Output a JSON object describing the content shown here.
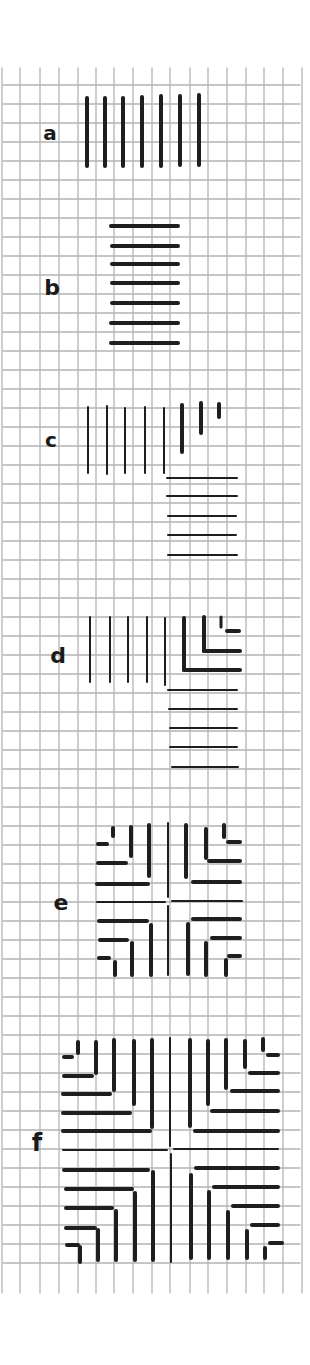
{
  "figure": {
    "background": "#ffffff",
    "grid": {
      "color": "#b4b4b4",
      "x_lines": [
        2,
        20,
        40,
        59,
        78,
        96,
        114,
        133,
        152,
        170,
        190,
        208,
        227,
        246,
        264,
        283,
        302
      ],
      "x_line_top": 68,
      "x_line_bottom": 1293,
      "y_start": 85,
      "y_step": 19,
      "y_count": 63,
      "h_left": 3,
      "h_right": 300
    },
    "ink": "#1e1e1e",
    "labels": [
      {
        "id": "a",
        "text": "a",
        "x": 50,
        "y": 133,
        "size": 20
      },
      {
        "id": "b",
        "text": "b",
        "x": 52,
        "y": 288,
        "size": 22
      },
      {
        "id": "c",
        "text": "c",
        "x": 51,
        "y": 440,
        "size": 20
      },
      {
        "id": "d",
        "text": "d",
        "x": 58,
        "y": 656,
        "size": 22
      },
      {
        "id": "e",
        "text": "e",
        "x": 61,
        "y": 903,
        "size": 22
      },
      {
        "id": "f",
        "text": "f",
        "x": 37,
        "y": 1143,
        "size": 24
      }
    ],
    "panels": [
      {
        "id": "a",
        "segments": [
          [
            87,
            98,
            87,
            166,
            4
          ],
          [
            105,
            98,
            105,
            166,
            4
          ],
          [
            123,
            98,
            123,
            166,
            4
          ],
          [
            142,
            97,
            142,
            166,
            4
          ],
          [
            161,
            96,
            161,
            166,
            4
          ],
          [
            180,
            96,
            180,
            165,
            4
          ],
          [
            199,
            95,
            199,
            165,
            4
          ]
        ]
      },
      {
        "id": "b",
        "segments": [
          [
            111,
            226,
            178,
            226,
            4
          ],
          [
            112,
            246,
            178,
            246,
            4
          ],
          [
            112,
            264,
            178,
            264,
            4
          ],
          [
            112,
            283,
            178,
            283,
            4
          ],
          [
            112,
            303,
            178,
            303,
            4
          ],
          [
            111,
            323,
            178,
            323,
            4
          ],
          [
            111,
            343,
            178,
            343,
            4
          ]
        ]
      },
      {
        "id": "c",
        "segments": [
          [
            88,
            407,
            88,
            473,
            2
          ],
          [
            107,
            406,
            107,
            474,
            2
          ],
          [
            125,
            408,
            125,
            473,
            2
          ],
          [
            145,
            407,
            145,
            473,
            2
          ],
          [
            164,
            408,
            164,
            473,
            2
          ],
          [
            182,
            405,
            182,
            452,
            4
          ],
          [
            201,
            403,
            201,
            433,
            4
          ],
          [
            219,
            404,
            219,
            417,
            4
          ],
          [
            167,
            478,
            237,
            478,
            2
          ],
          [
            167,
            496,
            237,
            496,
            2
          ],
          [
            168,
            516,
            236,
            516,
            2
          ],
          [
            168,
            535,
            236,
            535,
            2
          ],
          [
            168,
            555,
            237,
            555,
            2
          ]
        ]
      },
      {
        "id": "d",
        "segments": [
          [
            90,
            617,
            90,
            682,
            2
          ],
          [
            110,
            617,
            110,
            682,
            2
          ],
          [
            128,
            617,
            128,
            682,
            2
          ],
          [
            147,
            617,
            147,
            682,
            2
          ],
          [
            165,
            618,
            165,
            685,
            2
          ],
          [
            184,
            618,
            184,
            670,
            4
          ],
          [
            184,
            670,
            240,
            670,
            4
          ],
          [
            204,
            617,
            204,
            651,
            4
          ],
          [
            204,
            651,
            240,
            651,
            4
          ],
          [
            221,
            617,
            221,
            627,
            3
          ],
          [
            227,
            631,
            239,
            631,
            4
          ],
          [
            168,
            690,
            237,
            690,
            2
          ],
          [
            169,
            709,
            237,
            709,
            2
          ],
          [
            170,
            728,
            237,
            728,
            2
          ],
          [
            170,
            747,
            237,
            747,
            2
          ],
          [
            172,
            767,
            238,
            767,
            2
          ]
        ]
      },
      {
        "id": "e",
        "segments": [
          [
            168,
            823,
            168,
            897,
            2
          ],
          [
            168,
            906,
            168,
            975,
            2
          ],
          [
            97,
            902,
            165,
            902,
            2
          ],
          [
            172,
            901,
            242,
            901,
            2
          ],
          [
            149,
            825,
            149,
            876,
            4
          ],
          [
            131,
            827,
            131,
            856,
            4
          ],
          [
            113,
            828,
            113,
            836,
            4
          ],
          [
            97,
            884,
            148,
            884,
            4
          ],
          [
            98,
            863,
            126,
            863,
            4
          ],
          [
            98,
            844,
            107,
            844,
            4
          ],
          [
            186,
            825,
            186,
            877,
            4
          ],
          [
            206,
            829,
            206,
            858,
            4
          ],
          [
            224,
            825,
            224,
            837,
            4
          ],
          [
            193,
            882,
            240,
            882,
            4
          ],
          [
            209,
            861,
            240,
            861,
            4
          ],
          [
            228,
            842,
            240,
            842,
            4
          ],
          [
            99,
            921,
            147,
            921,
            4
          ],
          [
            100,
            940,
            127,
            940,
            4
          ],
          [
            99,
            958,
            109,
            958,
            4
          ],
          [
            151,
            925,
            151,
            975,
            4
          ],
          [
            132,
            943,
            132,
            975,
            4
          ],
          [
            115,
            962,
            115,
            975,
            4
          ],
          [
            193,
            919,
            240,
            919,
            4
          ],
          [
            212,
            938,
            240,
            938,
            4
          ],
          [
            229,
            956,
            240,
            956,
            4
          ],
          [
            188,
            924,
            188,
            974,
            4
          ],
          [
            206,
            943,
            206,
            975,
            4
          ],
          [
            226,
            960,
            226,
            975,
            4
          ]
        ]
      },
      {
        "id": "f",
        "segments": [
          [
            170,
            1038,
            170,
            1146,
            2
          ],
          [
            171,
            1154,
            171,
            1262,
            2
          ],
          [
            63,
            1150,
            167,
            1150,
            2
          ],
          [
            174,
            1149,
            278,
            1149,
            2
          ],
          [
            78,
            1042,
            78,
            1053,
            4
          ],
          [
            96,
            1042,
            96,
            1073,
            4
          ],
          [
            114,
            1040,
            114,
            1090,
            4
          ],
          [
            134,
            1041,
            134,
            1104,
            4
          ],
          [
            152,
            1040,
            152,
            1127,
            4
          ],
          [
            64,
            1057,
            72,
            1057,
            4
          ],
          [
            64,
            1076,
            92,
            1076,
            4
          ],
          [
            63,
            1094,
            110,
            1094,
            4
          ],
          [
            63,
            1113,
            130,
            1113,
            4
          ],
          [
            63,
            1131,
            150,
            1131,
            4
          ],
          [
            190,
            1040,
            190,
            1126,
            4
          ],
          [
            208,
            1041,
            208,
            1104,
            4
          ],
          [
            226,
            1040,
            226,
            1088,
            4
          ],
          [
            245,
            1041,
            245,
            1067,
            4
          ],
          [
            263,
            1039,
            263,
            1050,
            4
          ],
          [
            195,
            1131,
            278,
            1131,
            4
          ],
          [
            212,
            1111,
            278,
            1111,
            4
          ],
          [
            232,
            1091,
            278,
            1091,
            4
          ],
          [
            250,
            1073,
            278,
            1073,
            4
          ],
          [
            268,
            1055,
            278,
            1055,
            4
          ],
          [
            64,
            1170,
            148,
            1170,
            4
          ],
          [
            66,
            1189,
            132,
            1189,
            4
          ],
          [
            66,
            1208,
            112,
            1208,
            4
          ],
          [
            66,
            1228,
            95,
            1228,
            4
          ],
          [
            67,
            1245,
            78,
            1245,
            4
          ],
          [
            153,
            1172,
            153,
            1260,
            4
          ],
          [
            135,
            1193,
            135,
            1260,
            4
          ],
          [
            116,
            1211,
            116,
            1260,
            4
          ],
          [
            98,
            1230,
            98,
            1260,
            4
          ],
          [
            80,
            1247,
            80,
            1262,
            4
          ],
          [
            196,
            1168,
            278,
            1168,
            4
          ],
          [
            214,
            1187,
            278,
            1187,
            4
          ],
          [
            233,
            1206,
            278,
            1206,
            4
          ],
          [
            252,
            1225,
            278,
            1225,
            4
          ],
          [
            270,
            1243,
            282,
            1243,
            4
          ],
          [
            191,
            1175,
            191,
            1258,
            4
          ],
          [
            209,
            1192,
            209,
            1258,
            4
          ],
          [
            228,
            1212,
            228,
            1258,
            4
          ],
          [
            247,
            1231,
            247,
            1258,
            4
          ],
          [
            265,
            1248,
            265,
            1258,
            4
          ]
        ]
      }
    ]
  }
}
